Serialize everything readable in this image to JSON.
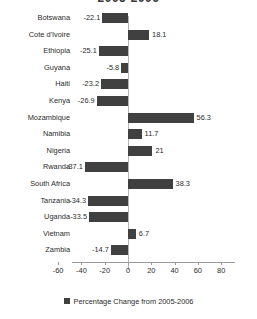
{
  "chart_data": {
    "type": "bar",
    "orientation": "horizontal",
    "title": "2005-2006",
    "xlabel": "",
    "ylabel": "",
    "xlim": [
      -60,
      80
    ],
    "xticks": [
      "-60",
      "-40",
      "-20",
      "0",
      "20",
      "40",
      "60",
      "80"
    ],
    "grid": false,
    "legend_position": "bottom",
    "series": [
      {
        "name": "Percentage Change from 2005-2006",
        "color": "#404040",
        "values": [
          -22.1,
          18.1,
          -25.1,
          -5.8,
          -23.2,
          -26.9,
          56.3,
          11.7,
          21,
          -37.1,
          38.3,
          -34.3,
          -33.5,
          6.7,
          -14.7
        ]
      }
    ],
    "categories": [
      "Botswana",
      "Cote d'Ivoire",
      "Ethiopia",
      "Guyana",
      "Haiti",
      "Kenya",
      "Mozambique",
      "Namibia",
      "Nigeria",
      "Rwanda",
      "South Africa",
      "Tanzania",
      "Uganda",
      "Vietnam",
      "Zambia"
    ],
    "data_labels": [
      "-22.1",
      "18.1",
      "-25.1",
      "-5.8",
      "-23.2",
      "-26.9",
      "56.3",
      "11.7",
      "21",
      "-37.1",
      "38.3",
      "-34.3",
      "-33.5",
      "6.7",
      "-14.7"
    ]
  },
  "legend": {
    "entries": [
      {
        "label": "Percentage Change from 2005-2006",
        "color": "#404040"
      }
    ]
  }
}
